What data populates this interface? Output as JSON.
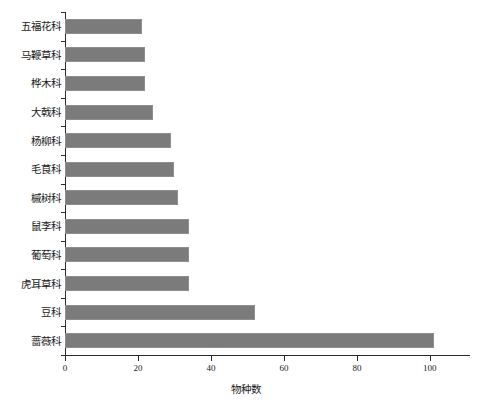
{
  "chart_data": {
    "type": "bar",
    "orientation": "horizontal",
    "title": "",
    "subtitle": "",
    "xlabel": "物种数",
    "ylabel": "",
    "categories": [
      "五福花科",
      "马鞭草科",
      "桦木科",
      "大戟科",
      "杨柳科",
      "毛茛科",
      "槭树科",
      "鼠李科",
      "葡萄科",
      "虎耳草科",
      "豆科",
      "蔷薇科"
    ],
    "values": [
      21,
      22,
      22,
      24,
      29,
      30,
      31,
      34,
      34,
      34,
      52,
      101
    ],
    "xlim": [
      0,
      111
    ],
    "ylim": [
      0,
      12
    ],
    "xticks": [
      0,
      20,
      40,
      60,
      80,
      100
    ],
    "xticklabels": [
      "0",
      "20",
      "40",
      "60",
      "80",
      "100"
    ],
    "grid": false,
    "legend": false,
    "legend_position": "none",
    "bar_color": "#7b7b7b",
    "bar_edge_color": "#8e8e8e",
    "axis_color": "#2b2b2b",
    "background_color": "#ffffff"
  }
}
